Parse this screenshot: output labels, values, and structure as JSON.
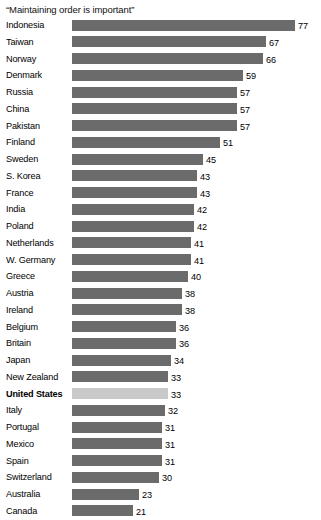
{
  "chart_data": {
    "type": "bar",
    "title": "“Maintaining order is important”",
    "xlabel": "",
    "ylabel": "",
    "orientation": "horizontal",
    "grid": false,
    "legend": false,
    "xlim": [
      0,
      77
    ],
    "axis_visible": false,
    "value_labels": true,
    "highlight_category": "United States",
    "colors": {
      "bar": "#6b6b6b",
      "bar_highlight": "#c9c9c9",
      "text": "#000000",
      "background": "#ffffff"
    },
    "categories": [
      "Indonesia",
      "Taiwan",
      "Norway",
      "Denmark",
      "Russia",
      "China",
      "Pakistan",
      "Finland",
      "Sweden",
      "S. Korea",
      "France",
      "India",
      "Poland",
      "Netherlands",
      "W. Germany",
      "Greece",
      "Austria",
      "Ireland",
      "Belgium",
      "Britain",
      "Japan",
      "New Zealand",
      "United States",
      "Italy",
      "Portugal",
      "Mexico",
      "Spain",
      "Switzerland",
      "Australia",
      "Canada"
    ],
    "values": [
      77,
      67,
      66,
      59,
      57,
      57,
      57,
      51,
      45,
      43,
      43,
      42,
      42,
      41,
      41,
      40,
      38,
      38,
      36,
      36,
      34,
      33,
      33,
      32,
      31,
      31,
      31,
      30,
      23,
      21
    ],
    "rows": [
      {
        "label": "Indonesia",
        "value": 77,
        "value_text": "77",
        "highlight": false
      },
      {
        "label": "Taiwan",
        "value": 67,
        "value_text": "67",
        "highlight": false
      },
      {
        "label": "Norway",
        "value": 66,
        "value_text": "66",
        "highlight": false
      },
      {
        "label": "Denmark",
        "value": 59,
        "value_text": "59",
        "highlight": false
      },
      {
        "label": "Russia",
        "value": 57,
        "value_text": "57",
        "highlight": false
      },
      {
        "label": "China",
        "value": 57,
        "value_text": "57",
        "highlight": false
      },
      {
        "label": "Pakistan",
        "value": 57,
        "value_text": "57",
        "highlight": false
      },
      {
        "label": "Finland",
        "value": 51,
        "value_text": "51",
        "highlight": false
      },
      {
        "label": "Sweden",
        "value": 45,
        "value_text": "45",
        "highlight": false
      },
      {
        "label": "S. Korea",
        "value": 43,
        "value_text": "43",
        "highlight": false
      },
      {
        "label": "France",
        "value": 43,
        "value_text": "43",
        "highlight": false
      },
      {
        "label": "India",
        "value": 42,
        "value_text": "42",
        "highlight": false
      },
      {
        "label": "Poland",
        "value": 42,
        "value_text": "42",
        "highlight": false
      },
      {
        "label": "Netherlands",
        "value": 41,
        "value_text": "41",
        "highlight": false
      },
      {
        "label": "W. Germany",
        "value": 41,
        "value_text": "41",
        "highlight": false
      },
      {
        "label": "Greece",
        "value": 40,
        "value_text": "40",
        "highlight": false
      },
      {
        "label": "Austria",
        "value": 38,
        "value_text": "38",
        "highlight": false
      },
      {
        "label": "Ireland",
        "value": 38,
        "value_text": "38",
        "highlight": false
      },
      {
        "label": "Belgium",
        "value": 36,
        "value_text": "36",
        "highlight": false
      },
      {
        "label": "Britain",
        "value": 36,
        "value_text": "36",
        "highlight": false
      },
      {
        "label": "Japan",
        "value": 34,
        "value_text": "34",
        "highlight": false
      },
      {
        "label": "New Zealand",
        "value": 33,
        "value_text": "33",
        "highlight": false
      },
      {
        "label": "United States",
        "value": 33,
        "value_text": "33",
        "highlight": true
      },
      {
        "label": "Italy",
        "value": 32,
        "value_text": "32",
        "highlight": false
      },
      {
        "label": "Portugal",
        "value": 31,
        "value_text": "31",
        "highlight": false
      },
      {
        "label": "Mexico",
        "value": 31,
        "value_text": "31",
        "highlight": false
      },
      {
        "label": "Spain",
        "value": 31,
        "value_text": "31",
        "highlight": false
      },
      {
        "label": "Switzerland",
        "value": 30,
        "value_text": "30",
        "highlight": false
      },
      {
        "label": "Australia",
        "value": 23,
        "value_text": "23",
        "highlight": false
      },
      {
        "label": "Canada",
        "value": 21,
        "value_text": "21",
        "highlight": false
      }
    ]
  },
  "layout": {
    "bar_origin_px": 72,
    "px_per_unit": 2.9,
    "value_gap_px": 3
  }
}
